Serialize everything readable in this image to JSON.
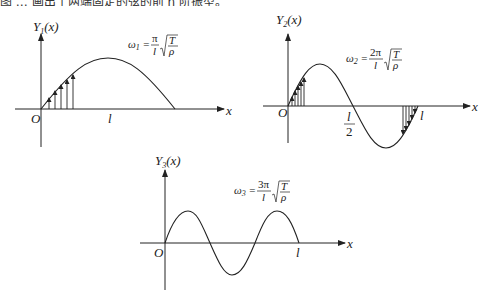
{
  "caption": {
    "text": "图 … 画出了两端固定的弦的前 n 阶振型。"
  },
  "panels": [
    {
      "id": "mode1",
      "y_axis_label": "Y",
      "y_axis_sub": "1",
      "y_axis_arg": "(x)",
      "x_axis_label": "x",
      "origin_label": "O",
      "length_label": "l",
      "formula": {
        "omega": "ω",
        "omega_sub": "1",
        "numerator": "π",
        "denominator": "l",
        "sqrt_num": "T",
        "sqrt_den": "ρ"
      },
      "mode_number": 1,
      "has_displacement_arrows": true
    },
    {
      "id": "mode2",
      "y_axis_label": "Y",
      "y_axis_sub": "2",
      "y_axis_arg": "(x)",
      "x_axis_label": "x",
      "origin_label": "O",
      "half_length_num": "l",
      "half_length_den": "2",
      "length_label": "l",
      "formula": {
        "omega": "ω",
        "omega_sub": "2",
        "numerator": "2π",
        "denominator": "l",
        "sqrt_num": "T",
        "sqrt_den": "ρ"
      },
      "mode_number": 2,
      "has_displacement_arrows": true
    },
    {
      "id": "mode3",
      "y_axis_label": "Y",
      "y_axis_sub": "3",
      "y_axis_arg": "(x)",
      "x_axis_label": "x",
      "origin_label": "O",
      "length_label": "l",
      "formula": {
        "omega": "ω",
        "omega_sub": "3",
        "numerator": "3π",
        "denominator": "l",
        "sqrt_num": "T",
        "sqrt_den": "ρ"
      },
      "mode_number": 3,
      "has_displacement_arrows": false
    }
  ]
}
